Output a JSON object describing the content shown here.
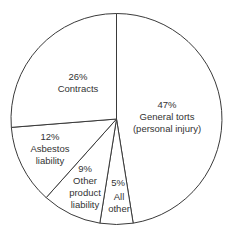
{
  "chart_data": {
    "type": "pie",
    "title": "",
    "start_angle_deg": 0,
    "direction": "clockwise",
    "slices": [
      {
        "label": "General torts (personal injury)",
        "value": 47,
        "pct_text": "47%",
        "lines": [
          "General torts",
          "(personal injury)"
        ]
      },
      {
        "label": "All other",
        "value": 5,
        "pct_text": "5%",
        "lines": [
          "All",
          "other"
        ]
      },
      {
        "label": "Other product liability",
        "value": 9,
        "pct_text": "9%",
        "lines": [
          "Other",
          "product",
          "liability"
        ]
      },
      {
        "label": "Asbestos liability",
        "value": 12,
        "pct_text": "12%",
        "lines": [
          "Asbestos",
          "liability"
        ]
      },
      {
        "label": "Contracts",
        "value": 26,
        "pct_text": "26%",
        "lines": [
          "Contracts"
        ]
      }
    ],
    "legend": "none",
    "colors": {
      "fill": "#ffffff",
      "stroke": "#3a3a3a",
      "text": "#333333"
    }
  },
  "labels": {
    "general_torts": {
      "pct": "47%",
      "l1": "General torts",
      "l2": "(personal injury)"
    },
    "all_other": {
      "pct": "5%",
      "l1": "All",
      "l2": "other"
    },
    "other_product": {
      "pct": "9%",
      "l1": "Other",
      "l2": "product",
      "l3": "liability"
    },
    "asbestos": {
      "pct": "12%",
      "l1": "Asbestos",
      "l2": "liability"
    },
    "contracts": {
      "pct": "26%",
      "l1": "Contracts"
    }
  }
}
